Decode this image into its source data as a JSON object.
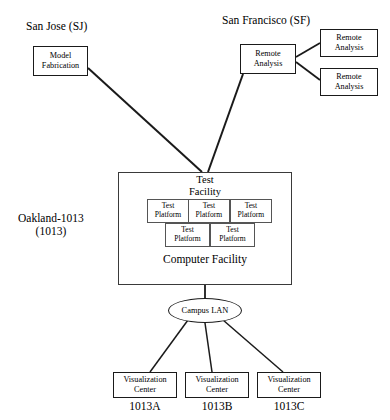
{
  "diagram": {
    "type": "network-topology",
    "site_labels": [
      {
        "id": "san-jose",
        "text": "San Jose (SJ)",
        "x": 26,
        "y": 20
      },
      {
        "id": "san-francisco",
        "text": "San Francisco (SF)",
        "x": 222,
        "y": 14
      },
      {
        "id": "oakland",
        "text": "Oakland-1013\n(1013)",
        "x": 18,
        "y": 212
      }
    ],
    "nodes": [
      {
        "id": "model-fabrication",
        "label": "Model\nFabrication",
        "x": 33,
        "y": 46,
        "w": 55,
        "h": 30
      },
      {
        "id": "remote-analysis-hub",
        "label": "Remote\nAnalysis",
        "x": 240,
        "y": 44,
        "w": 56,
        "h": 30
      },
      {
        "id": "remote-analysis-1",
        "label": "Remote\nAnalysis",
        "x": 320,
        "y": 29,
        "w": 58,
        "h": 28
      },
      {
        "id": "remote-analysis-2",
        "label": "Remote\nAnalysis",
        "x": 320,
        "y": 68,
        "w": 58,
        "h": 28
      }
    ],
    "facility": {
      "id": "oakland-facility",
      "x": 118,
      "y": 172,
      "w": 174,
      "h": 113,
      "top_caption": "Test\nFacility",
      "bottom_caption": "Computer Facility",
      "platforms_row_top": [
        {
          "id": "test-platform-1",
          "label": "Test\nPlatform"
        },
        {
          "id": "test-platform-2",
          "label": "Test\nPlatform"
        },
        {
          "id": "test-platform-3",
          "label": "Test\nPlatform"
        }
      ],
      "platforms_row_bottom": [
        {
          "id": "test-platform-4",
          "label": "Test\nPlatform"
        },
        {
          "id": "test-platform-5",
          "label": "Test\nPlatform"
        }
      ],
      "platform_grid": {
        "top_x": 147,
        "top_y": 199,
        "top_cell_w": 42,
        "top_cell_h": 24,
        "bottom_x": 165,
        "bottom_y": 223,
        "bottom_cell_w": 45,
        "bottom_cell_h": 24
      }
    },
    "lan": {
      "id": "campus-lan",
      "label": "Campus LAN",
      "x": 168,
      "y": 298,
      "w": 74,
      "h": 25
    },
    "visualization_centers": [
      {
        "id": "viz-center-a",
        "label": "Visualization\nCenter",
        "caption": "1013A",
        "x": 113,
        "y": 372,
        "w": 64,
        "h": 26
      },
      {
        "id": "viz-center-b",
        "label": "Visualization\nCenter",
        "caption": "1013B",
        "x": 185,
        "y": 372,
        "w": 64,
        "h": 26
      },
      {
        "id": "viz-center-c",
        "label": "Visualization\nCenter",
        "caption": "1013C",
        "x": 257,
        "y": 372,
        "w": 64,
        "h": 26
      }
    ],
    "edges": [
      {
        "id": "edge-model-fab-to-test-facility",
        "from": "model-fabrication",
        "to": "test-facility",
        "x1": 88,
        "y1": 68,
        "x2": 202,
        "y2": 172,
        "width": 2.0
      },
      {
        "id": "edge-remote-hub-to-test-facility",
        "from": "remote-analysis-hub",
        "to": "test-facility",
        "x1": 243,
        "y1": 74,
        "x2": 208,
        "y2": 172,
        "width": 2.0
      },
      {
        "id": "edge-remote-hub-to-remote-1",
        "from": "remote-analysis-hub",
        "to": "remote-analysis-1",
        "x1": 296,
        "y1": 57,
        "x2": 320,
        "y2": 43,
        "width": 1.8
      },
      {
        "id": "edge-remote-hub-to-remote-2",
        "from": "remote-analysis-hub",
        "to": "remote-analysis-2",
        "x1": 296,
        "y1": 62,
        "x2": 320,
        "y2": 80,
        "width": 1.8
      },
      {
        "id": "edge-facility-to-lan",
        "from": "oakland-facility",
        "to": "campus-lan",
        "x1": 205,
        "y1": 285,
        "x2": 205,
        "y2": 298,
        "width": 1.8
      },
      {
        "id": "edge-lan-to-viz-a",
        "from": "campus-lan",
        "to": "viz-center-a",
        "x1": 188,
        "y1": 320,
        "x2": 150,
        "y2": 372,
        "width": 1.5
      },
      {
        "id": "edge-lan-to-viz-b",
        "from": "campus-lan",
        "to": "viz-center-b",
        "x1": 205,
        "y1": 323,
        "x2": 212,
        "y2": 372,
        "width": 1.5
      },
      {
        "id": "edge-lan-to-viz-c",
        "from": "campus-lan",
        "to": "viz-center-c",
        "x1": 223,
        "y1": 320,
        "x2": 283,
        "y2": 372,
        "width": 1.5
      }
    ],
    "colors": {
      "stroke": "#1a1a1a",
      "background": "#ffffff",
      "inner_stroke": "#555555"
    }
  }
}
